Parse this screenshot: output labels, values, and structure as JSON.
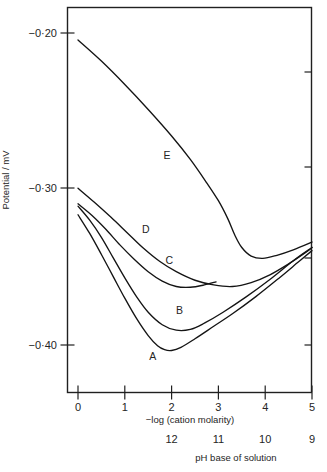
{
  "chart_data": {
    "type": "line",
    "title": "",
    "xlabel": "−log (cation molarity)",
    "ylabel": "Potential / mV",
    "xlim": [
      0,
      5
    ],
    "ylim": [
      -0.425,
      -0.178
    ],
    "grid": false,
    "legend": "inline-curve-labels",
    "xticks": [
      "0",
      "1",
      "2",
      "3",
      "4",
      "5"
    ],
    "yticks": [
      "−0·20",
      "−0·30",
      "−0·40"
    ],
    "ytick_values": [
      -0.2,
      -0.3,
      -0.4
    ],
    "secondary_axis": {
      "label": "pH base of solution",
      "ticks": [
        "12",
        "11",
        "10",
        "9"
      ],
      "tick_x_positions": [
        2,
        3,
        4,
        5
      ]
    },
    "series": [
      {
        "name": "A",
        "label_x": 1.6,
        "label_y": -0.4095,
        "points": [
          [
            0.0,
            -0.3165
          ],
          [
            0.25,
            -0.3285
          ],
          [
            0.5,
            -0.342
          ],
          [
            0.75,
            -0.356
          ],
          [
            1.0,
            -0.37
          ],
          [
            1.25,
            -0.383
          ],
          [
            1.5,
            -0.394
          ],
          [
            1.7,
            -0.4005
          ],
          [
            1.85,
            -0.403
          ],
          [
            2.0,
            -0.4035
          ],
          [
            2.2,
            -0.4015
          ],
          [
            2.5,
            -0.396
          ],
          [
            2.9,
            -0.388
          ],
          [
            3.3,
            -0.38
          ],
          [
            3.8,
            -0.369
          ],
          [
            4.3,
            -0.357
          ],
          [
            4.7,
            -0.347
          ],
          [
            5.0,
            -0.3395
          ]
        ]
      },
      {
        "name": "B",
        "label_x": 2.17,
        "label_y": -0.38,
        "points": [
          [
            0.0,
            -0.311
          ],
          [
            0.25,
            -0.32
          ],
          [
            0.5,
            -0.331
          ],
          [
            0.75,
            -0.344
          ],
          [
            1.0,
            -0.357
          ],
          [
            1.25,
            -0.369
          ],
          [
            1.5,
            -0.379
          ],
          [
            1.8,
            -0.387
          ],
          [
            2.1,
            -0.3905
          ],
          [
            2.4,
            -0.39
          ],
          [
            2.7,
            -0.386
          ],
          [
            3.1,
            -0.379
          ],
          [
            3.6,
            -0.369
          ],
          [
            4.1,
            -0.358
          ],
          [
            4.6,
            -0.346
          ],
          [
            5.0,
            -0.3375
          ]
        ]
      },
      {
        "name": "C",
        "label_x": 1.95,
        "label_y": -0.348,
        "points": [
          [
            0.0,
            -0.3095
          ],
          [
            0.3,
            -0.317
          ],
          [
            0.6,
            -0.326
          ],
          [
            0.9,
            -0.336
          ],
          [
            1.2,
            -0.345
          ],
          [
            1.5,
            -0.353
          ],
          [
            1.8,
            -0.359
          ],
          [
            2.1,
            -0.3625
          ],
          [
            2.4,
            -0.363
          ],
          [
            2.7,
            -0.3615
          ],
          [
            2.95,
            -0.3595
          ]
        ]
      },
      {
        "name": "D",
        "label_x": 1.45,
        "label_y": -0.328,
        "points": [
          [
            0.0,
            -0.2995
          ],
          [
            0.35,
            -0.3085
          ],
          [
            0.7,
            -0.318
          ],
          [
            1.05,
            -0.328
          ],
          [
            1.4,
            -0.338
          ],
          [
            1.75,
            -0.3465
          ],
          [
            2.1,
            -0.353
          ],
          [
            2.5,
            -0.3585
          ],
          [
            2.9,
            -0.3615
          ],
          [
            3.3,
            -0.3625
          ],
          [
            3.7,
            -0.36
          ],
          [
            4.1,
            -0.355
          ],
          [
            4.5,
            -0.348
          ],
          [
            4.85,
            -0.341
          ],
          [
            5.0,
            -0.3375
          ]
        ]
      },
      {
        "name": "E",
        "label_x": 1.9,
        "label_y": -0.281,
        "points": [
          [
            0.0,
            -0.2045
          ],
          [
            0.5,
            -0.218
          ],
          [
            1.0,
            -0.233
          ],
          [
            1.5,
            -0.249
          ],
          [
            2.0,
            -0.266
          ],
          [
            2.4,
            -0.281
          ],
          [
            2.75,
            -0.296
          ],
          [
            3.0,
            -0.3075
          ],
          [
            3.2,
            -0.319
          ],
          [
            3.35,
            -0.3295
          ],
          [
            3.5,
            -0.3375
          ],
          [
            3.7,
            -0.343
          ],
          [
            3.95,
            -0.3445
          ],
          [
            4.25,
            -0.3425
          ],
          [
            4.6,
            -0.339
          ],
          [
            5.0,
            -0.334
          ]
        ]
      }
    ]
  }
}
